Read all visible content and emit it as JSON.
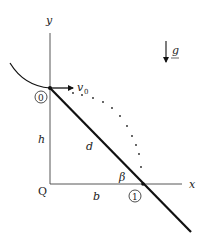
{
  "diagram": {
    "axes": {
      "x_label": "x",
      "y_label": "y",
      "origin_label": "Q"
    },
    "points": {
      "start": "0",
      "end": "1"
    },
    "labels": {
      "velocity": "v",
      "velocity_sub": "0",
      "height": "h",
      "distance": "d",
      "base": "b",
      "angle": "β",
      "gravity": "g"
    },
    "colors": {
      "line": "#111111",
      "axis": "#444444",
      "background": "#ffffff"
    }
  }
}
